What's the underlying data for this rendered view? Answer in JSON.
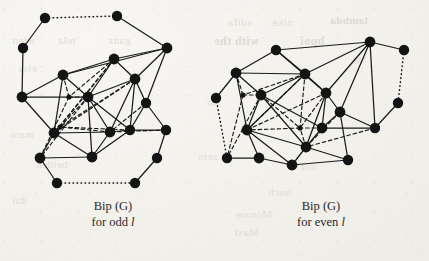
{
  "figure": {
    "kind": "mathematical-graph-figure",
    "background_color": "#f2f1ec",
    "ink_color": "#1a1a1a",
    "node_fill": "#141414"
  },
  "captions": {
    "left": {
      "line1": "Bip (G)",
      "line2_prefix": "for odd ",
      "line2_symbol": "l"
    },
    "right": {
      "line1": "Bip (G)",
      "line2_prefix": "for even ",
      "line2_symbol": "l"
    }
  },
  "ghost_text": [
    {
      "text": "sdifa",
      "x": 228,
      "y": 16,
      "size": 11,
      "bold": false
    },
    {
      "text": "nike",
      "x": 272,
      "y": 16,
      "size": 11,
      "bold": false
    },
    {
      "text": "lambda",
      "x": 330,
      "y": 14,
      "size": 11,
      "bold": true
    },
    {
      "text": "with the",
      "x": 214,
      "y": 34,
      "size": 12,
      "bold": true
    },
    {
      "text": "bpoi",
      "x": 300,
      "y": 34,
      "size": 12,
      "bold": true
    },
    {
      "text": "wien",
      "x": 12,
      "y": 34,
      "size": 11,
      "bold": false
    },
    {
      "text": "tela",
      "x": 58,
      "y": 34,
      "size": 11,
      "bold": false
    },
    {
      "text": "ganz",
      "x": 108,
      "y": 34,
      "size": 11,
      "bold": false
    },
    {
      "text": "sig",
      "x": 352,
      "y": 52,
      "size": 11,
      "bold": false
    },
    {
      "text": "elsa",
      "x": 18,
      "y": 62,
      "size": 11,
      "bold": false
    },
    {
      "text": "tor",
      "x": 206,
      "y": 96,
      "size": 11,
      "bold": false
    },
    {
      "text": "maro",
      "x": 10,
      "y": 128,
      "size": 11,
      "bold": false
    },
    {
      "text": "beiden",
      "x": 36,
      "y": 158,
      "size": 11,
      "bold": false
    },
    {
      "text": "sein",
      "x": 198,
      "y": 150,
      "size": 11,
      "bold": false
    },
    {
      "text": "nur",
      "x": 300,
      "y": 160,
      "size": 11,
      "bold": false
    },
    {
      "text": "hoch",
      "x": 268,
      "y": 186,
      "size": 11,
      "bold": false
    },
    {
      "text": "dal",
      "x": 12,
      "y": 194,
      "size": 11,
      "bold": false
    },
    {
      "text": "Monate",
      "x": 236,
      "y": 208,
      "size": 11,
      "bold": false
    },
    {
      "text": "Maxi",
      "x": 234,
      "y": 226,
      "size": 11,
      "bold": false
    }
  ],
  "graphs": [
    {
      "id": "bip-g-odd",
      "label": "Bip (G) for odd l",
      "nodes": [
        {
          "id": "L1",
          "x": 45,
          "y": 18,
          "r": 5.2
        },
        {
          "id": "L2",
          "x": 117,
          "y": 16,
          "r": 5.2
        },
        {
          "id": "L3",
          "x": 23,
          "y": 48,
          "r": 5.2
        },
        {
          "id": "L4",
          "x": 167,
          "y": 48,
          "r": 5.4
        },
        {
          "id": "L5",
          "x": 63,
          "y": 75,
          "r": 5.4
        },
        {
          "id": "L6",
          "x": 114,
          "y": 59,
          "r": 5.4
        },
        {
          "id": "L7",
          "x": 135,
          "y": 79,
          "r": 5.4
        },
        {
          "id": "L8",
          "x": 22,
          "y": 97,
          "r": 5.4
        },
        {
          "id": "L9",
          "x": 88,
          "y": 97,
          "r": 5.4
        },
        {
          "id": "L10",
          "x": 69,
          "y": 97,
          "r": 2.6
        },
        {
          "id": "L11",
          "x": 146,
          "y": 103,
          "r": 5.2
        },
        {
          "id": "L12",
          "x": 54,
          "y": 133,
          "r": 5.4
        },
        {
          "id": "L13",
          "x": 110,
          "y": 132,
          "r": 5.4
        },
        {
          "id": "L14",
          "x": 130,
          "y": 130,
          "r": 5.2
        },
        {
          "id": "L15",
          "x": 60,
          "y": 127,
          "r": 2.6
        },
        {
          "id": "L16",
          "x": 166,
          "y": 130,
          "r": 5.2
        },
        {
          "id": "L17",
          "x": 40,
          "y": 158,
          "r": 5.4
        },
        {
          "id": "L18",
          "x": 92,
          "y": 157,
          "r": 5.4
        },
        {
          "id": "L19",
          "x": 157,
          "y": 158,
          "r": 5.2
        },
        {
          "id": "L20",
          "x": 57,
          "y": 183,
          "r": 5.2
        },
        {
          "id": "L21",
          "x": 135,
          "y": 183,
          "r": 5.2
        }
      ],
      "edges_solid": [
        [
          "L1",
          "L3"
        ],
        [
          "L2",
          "L4"
        ],
        [
          "L3",
          "L8"
        ],
        [
          "L4",
          "L6"
        ],
        [
          "L4",
          "L7"
        ],
        [
          "L4",
          "L11"
        ],
        [
          "L4",
          "L5"
        ],
        [
          "L5",
          "L6"
        ],
        [
          "L5",
          "L8"
        ],
        [
          "L5",
          "L9"
        ],
        [
          "L5",
          "L12"
        ],
        [
          "L6",
          "L7"
        ],
        [
          "L6",
          "L9"
        ],
        [
          "L7",
          "L9"
        ],
        [
          "L7",
          "L11"
        ],
        [
          "L7",
          "L14"
        ],
        [
          "L7",
          "L13"
        ],
        [
          "L8",
          "L9"
        ],
        [
          "L8",
          "L12"
        ],
        [
          "L9",
          "L13"
        ],
        [
          "L9",
          "L18"
        ],
        [
          "L9",
          "L14"
        ],
        [
          "L11",
          "L14"
        ],
        [
          "L11",
          "L16"
        ],
        [
          "L12",
          "L17"
        ],
        [
          "L12",
          "L13"
        ],
        [
          "L12",
          "L18"
        ],
        [
          "L13",
          "L18"
        ],
        [
          "L13",
          "L14"
        ],
        [
          "L14",
          "L16"
        ],
        [
          "L14",
          "L18"
        ],
        [
          "L16",
          "L19"
        ],
        [
          "L17",
          "L18"
        ],
        [
          "L17",
          "L20"
        ],
        [
          "L19",
          "L21"
        ]
      ],
      "edges_dashed": [
        [
          "L5",
          "L10"
        ],
        [
          "L10",
          "L9"
        ],
        [
          "L6",
          "L10"
        ],
        [
          "L6",
          "L12"
        ],
        [
          "L6",
          "L15"
        ],
        [
          "L7",
          "L15"
        ],
        [
          "L7",
          "L12"
        ],
        [
          "L9",
          "L15"
        ],
        [
          "L15",
          "L12"
        ],
        [
          "L10",
          "L17"
        ],
        [
          "L9",
          "L17"
        ],
        [
          "L13",
          "L15"
        ],
        [
          "L14",
          "L15"
        ],
        [
          "L16",
          "L13"
        ],
        [
          "L11",
          "L13"
        ]
      ],
      "edges_dotted": [
        [
          "L1",
          "L2"
        ],
        [
          "L20",
          "L21"
        ]
      ]
    },
    {
      "id": "bip-g-even",
      "label": "Bip (G) for even l",
      "nodes": [
        {
          "id": "R1",
          "x": 276,
          "y": 50,
          "r": 5.2
        },
        {
          "id": "R2",
          "x": 370,
          "y": 42,
          "r": 5.4
        },
        {
          "id": "R3",
          "x": 404,
          "y": 50,
          "r": 5.2
        },
        {
          "id": "R4",
          "x": 236,
          "y": 73,
          "r": 5.4
        },
        {
          "id": "R5",
          "x": 305,
          "y": 74,
          "r": 5.4
        },
        {
          "id": "R6",
          "x": 326,
          "y": 93,
          "r": 5.4
        },
        {
          "id": "R7",
          "x": 216,
          "y": 98,
          "r": 5.2
        },
        {
          "id": "R8",
          "x": 261,
          "y": 95,
          "r": 5.4
        },
        {
          "id": "R9",
          "x": 243,
          "y": 95,
          "r": 2.6
        },
        {
          "id": "R10",
          "x": 340,
          "y": 112,
          "r": 5.4
        },
        {
          "id": "R11",
          "x": 398,
          "y": 103,
          "r": 5.2
        },
        {
          "id": "R12",
          "x": 247,
          "y": 130,
          "r": 5.4
        },
        {
          "id": "R13",
          "x": 300,
          "y": 128,
          "r": 2.6
        },
        {
          "id": "R14",
          "x": 322,
          "y": 128,
          "r": 5.4
        },
        {
          "id": "R15",
          "x": 375,
          "y": 128,
          "r": 5.2
        },
        {
          "id": "R16",
          "x": 306,
          "y": 147,
          "r": 5.4
        },
        {
          "id": "R17",
          "x": 227,
          "y": 158,
          "r": 5.2
        },
        {
          "id": "R18",
          "x": 259,
          "y": 158,
          "r": 5.4
        },
        {
          "id": "R19",
          "x": 348,
          "y": 160,
          "r": 5.2
        },
        {
          "id": "R20",
          "x": 292,
          "y": 165,
          "r": 5.4
        }
      ],
      "edges_solid": [
        [
          "R1",
          "R2"
        ],
        [
          "R2",
          "R3"
        ],
        [
          "R1",
          "R4"
        ],
        [
          "R1",
          "R5"
        ],
        [
          "R1",
          "R6"
        ],
        [
          "R2",
          "R6"
        ],
        [
          "R2",
          "R10"
        ],
        [
          "R2",
          "R5"
        ],
        [
          "R2",
          "R15"
        ],
        [
          "R4",
          "R5"
        ],
        [
          "R4",
          "R8"
        ],
        [
          "R4",
          "R12"
        ],
        [
          "R4",
          "R7"
        ],
        [
          "R5",
          "R6"
        ],
        [
          "R5",
          "R8"
        ],
        [
          "R5",
          "R12"
        ],
        [
          "R6",
          "R10"
        ],
        [
          "R6",
          "R14"
        ],
        [
          "R6",
          "R16"
        ],
        [
          "R8",
          "R12"
        ],
        [
          "R8",
          "R16"
        ],
        [
          "R8",
          "R14"
        ],
        [
          "R10",
          "R14"
        ],
        [
          "R10",
          "R15"
        ],
        [
          "R10",
          "R19"
        ],
        [
          "R11",
          "R15"
        ],
        [
          "R12",
          "R18"
        ],
        [
          "R12",
          "R16"
        ],
        [
          "R14",
          "R15"
        ],
        [
          "R14",
          "R16"
        ],
        [
          "R16",
          "R20"
        ],
        [
          "R16",
          "R19"
        ],
        [
          "R17",
          "R18"
        ],
        [
          "R18",
          "R20"
        ],
        [
          "R20",
          "R19"
        ],
        [
          "R12",
          "R20"
        ]
      ],
      "edges_dashed": [
        [
          "R4",
          "R9"
        ],
        [
          "R9",
          "R8"
        ],
        [
          "R5",
          "R9"
        ],
        [
          "R5",
          "R12"
        ],
        [
          "R5",
          "R13"
        ],
        [
          "R6",
          "R13"
        ],
        [
          "R6",
          "R12"
        ],
        [
          "R8",
          "R13"
        ],
        [
          "R13",
          "R12"
        ],
        [
          "R9",
          "R17"
        ],
        [
          "R8",
          "R17"
        ],
        [
          "R14",
          "R13"
        ],
        [
          "R16",
          "R13"
        ],
        [
          "R15",
          "R16"
        ],
        [
          "R10",
          "R16"
        ]
      ],
      "edges_dotted": [
        [
          "R3",
          "R11"
        ],
        [
          "R7",
          "R17"
        ]
      ]
    }
  ]
}
